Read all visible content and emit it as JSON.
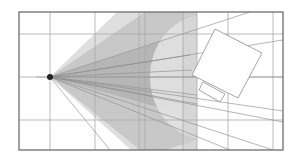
{
  "diagram": {
    "title": "",
    "colors": {
      "background": "#ffffff",
      "border": "#6e6e6e",
      "grid": "#a8a8a8",
      "cone_light": "#d9d9d9",
      "cone_mid": "#c4c4c4",
      "cone_dark": "#b3b3b3",
      "ray": "#8c8c8c",
      "object_stroke": "#9a9a9a",
      "source": "#222222"
    },
    "frame": {
      "x": 19,
      "y": 12,
      "width": 264,
      "height": 138
    },
    "grid": {
      "vertical_x": [
        50,
        95,
        139,
        145,
        183,
        197,
        228,
        273
      ],
      "horizontal_y": [
        34,
        77,
        120
      ]
    },
    "source": {
      "x": 50,
      "y": 77,
      "radius": 3
    },
    "clip_x": 197,
    "cones": [
      {
        "name": "outer-cone",
        "points": [
          [
            50,
            77
          ],
          [
            117,
            12
          ],
          [
            197,
            12
          ],
          [
            197,
            150
          ],
          [
            131,
            150
          ]
        ],
        "shade": "light"
      },
      {
        "name": "inner-cone",
        "points": [
          [
            50,
            77
          ],
          [
            145,
            12
          ],
          [
            195,
            12
          ],
          [
            197,
            12
          ],
          [
            197,
            140
          ],
          [
            165,
            150
          ],
          [
            140,
            150
          ]
        ],
        "shade": "mid"
      },
      {
        "name": "core-cone",
        "points": [
          [
            50,
            77
          ],
          [
            197,
            30
          ],
          [
            197,
            118
          ]
        ],
        "shade": "dark"
      }
    ],
    "highlight_ellipse": {
      "cx": 205,
      "cy": 77,
      "rx": 55,
      "ry": 62
    },
    "rays": [
      {
        "to": [
          250,
          12
        ]
      },
      {
        "to": [
          283,
          40
        ]
      },
      {
        "to": [
          283,
          77
        ]
      },
      {
        "to": [
          283,
          111
        ]
      },
      {
        "to": [
          283,
          122
        ]
      },
      {
        "to": [
          273,
          150
        ]
      },
      {
        "to": [
          230,
          150
        ]
      },
      {
        "to": [
          110,
          150
        ]
      },
      {
        "to": [
          190,
          55
        ]
      },
      {
        "to": [
          192,
          70
        ]
      },
      {
        "to": [
          197,
          95
        ]
      },
      {
        "to": [
          197,
          104
        ]
      }
    ],
    "object": {
      "name": "rotated-box",
      "body": [
        [
          215,
          29
        ],
        [
          262,
          53
        ],
        [
          238,
          98
        ],
        [
          192,
          75
        ]
      ],
      "tab": [
        [
          203,
          82
        ],
        [
          225,
          94
        ],
        [
          220,
          102
        ],
        [
          199,
          90
        ]
      ]
    }
  }
}
